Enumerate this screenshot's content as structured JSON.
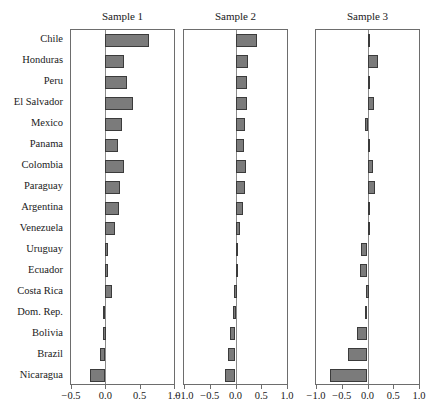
{
  "chart_data": {
    "type": "bar",
    "orientation": "horizontal",
    "title": "",
    "xlabel": "",
    "ylabel": "",
    "grid": false,
    "legend": false,
    "categories": [
      "Chile",
      "Honduras",
      "Peru",
      "El Salvador",
      "Mexico",
      "Panama",
      "Colombia",
      "Paraguay",
      "Argentina",
      "Venezuela",
      "Uruguay",
      "Ecuador",
      "Costa Rica",
      "Dom. Rep.",
      "Bolivia",
      "Brazil",
      "Nicaragua"
    ],
    "panels": [
      {
        "title": "Sample 1",
        "xlim": [
          -0.5,
          1.0
        ],
        "xticks": [
          -0.5,
          0.0,
          0.5,
          1.0
        ],
        "xticklabels": [
          "-0.5",
          "0.0",
          "0.5",
          "1.0"
        ],
        "values": [
          0.63,
          0.27,
          0.31,
          0.4,
          0.24,
          0.19,
          0.27,
          0.21,
          0.2,
          0.14,
          0.04,
          0.02,
          0.1,
          -0.04,
          -0.03,
          -0.08,
          -0.22
        ]
      },
      {
        "title": "Sample 2",
        "xlim": [
          -1.0,
          1.0
        ],
        "xticks": [
          -1.0,
          -0.5,
          0.0,
          0.5,
          1.0
        ],
        "xticklabels": [
          "-1.0",
          "-0.5",
          "0.0",
          "0.5",
          "1.0"
        ],
        "values": [
          0.42,
          0.25,
          0.23,
          0.23,
          0.19,
          0.16,
          0.2,
          0.19,
          0.14,
          0.09,
          0.02,
          0.0,
          -0.02,
          -0.04,
          -0.1,
          -0.15,
          -0.2
        ]
      },
      {
        "title": "Sample 3",
        "xlim": [
          -1.0,
          1.0
        ],
        "xticks": [
          -1.0,
          -0.5,
          0.0,
          0.5,
          1.0
        ],
        "xticklabels": [
          "-1.0",
          "-0.5",
          "0.0",
          "0.5",
          "1.0"
        ],
        "values": [
          0.05,
          0.2,
          0.02,
          0.13,
          -0.04,
          0.03,
          0.1,
          0.15,
          0.02,
          0.02,
          -0.13,
          -0.14,
          -0.02,
          -0.05,
          -0.2,
          -0.38,
          -0.72
        ]
      }
    ],
    "series": [
      {
        "name": "Sample 1",
        "values": [
          0.63,
          0.27,
          0.31,
          0.4,
          0.24,
          0.19,
          0.27,
          0.21,
          0.2,
          0.14,
          0.04,
          0.02,
          0.1,
          -0.04,
          -0.03,
          -0.08,
          -0.22
        ]
      },
      {
        "name": "Sample 2",
        "values": [
          0.42,
          0.25,
          0.23,
          0.23,
          0.19,
          0.16,
          0.2,
          0.19,
          0.14,
          0.09,
          0.02,
          0.0,
          -0.02,
          -0.04,
          -0.1,
          -0.15,
          -0.2
        ]
      },
      {
        "name": "Sample 3",
        "values": [
          0.05,
          0.2,
          0.02,
          0.13,
          -0.04,
          0.03,
          0.1,
          0.15,
          0.02,
          0.02,
          -0.13,
          -0.14,
          -0.02,
          -0.05,
          -0.2,
          -0.38,
          -0.72
        ]
      }
    ],
    "colors": {
      "bar_fill": "#7b7b7b",
      "bar_edge": "#3b3b3b",
      "axis": "#6d6d6d",
      "text": "#1a1a1a",
      "background": "#ffffff"
    }
  }
}
